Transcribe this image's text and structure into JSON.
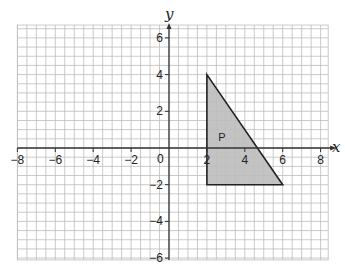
{
  "chart_data": {
    "type": "scatter",
    "title": "",
    "xlabel": "x",
    "ylabel": "y",
    "xlim": [
      -8,
      8.4
    ],
    "ylim": [
      -6.1,
      6.7
    ],
    "grid": true,
    "grid_minor_step": 0.5,
    "x_ticks": [
      -8,
      -6,
      -4,
      -2,
      2,
      4,
      6,
      8
    ],
    "x_tick_labels": [
      "−8",
      "−6",
      "−4",
      "−2",
      "2",
      "4",
      "6",
      "8"
    ],
    "y_ticks": [
      6,
      4,
      2,
      -2,
      -4,
      -6
    ],
    "y_tick_labels": [
      "6",
      "4",
      "2",
      "−2",
      "−4",
      "−6"
    ],
    "origin_label": "0",
    "shapes": [
      {
        "name": "P",
        "type": "polygon",
        "vertices": [
          [
            2,
            4
          ],
          [
            6,
            -2
          ],
          [
            2,
            -2
          ]
        ],
        "fill": "#bdbdbd",
        "label_position": [
          2.6,
          0.6
        ]
      }
    ]
  },
  "colors": {
    "grid": "#bcbcbc",
    "axis": "#333333",
    "shape_fill": "#bdbdbd",
    "shape_stroke": "#222222"
  }
}
